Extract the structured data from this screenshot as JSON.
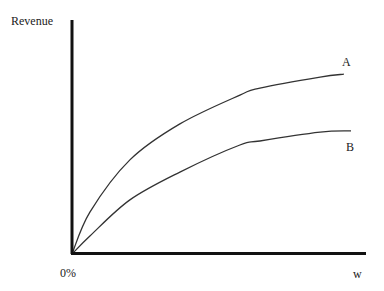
{
  "chart_data": {
    "type": "line",
    "title": "",
    "xlabel": "w",
    "ylabel": "Revenue",
    "x_tick_labels": {
      "origin": "0%",
      "end": "w"
    },
    "xlim": [
      0,
      100
    ],
    "ylim": [
      0,
      100
    ],
    "grid": false,
    "legend": "inline labels at line ends",
    "series": [
      {
        "name": "A",
        "x": [
          0,
          6.1,
          19.7,
          36.7,
          57.1,
          63.9,
          84.4,
          92.5
        ],
        "y": [
          0,
          17.9,
          40.2,
          55.6,
          67.9,
          70.9,
          75.6,
          76.9
        ]
      },
      {
        "name": "B",
        "x": [
          0,
          6.1,
          19.7,
          36.7,
          57.1,
          63.9,
          84.4,
          94.9
        ],
        "y": [
          0,
          7.7,
          23.1,
          35.0,
          46.6,
          48.3,
          52.1,
          52.6
        ]
      }
    ],
    "annotations": [
      "A",
      "B"
    ]
  },
  "labels": {
    "y_axis": "Revenue",
    "x_origin": "0%",
    "x_end": "w",
    "curve_a": "A",
    "curve_b": "B"
  },
  "colors": {
    "axis": "#111111",
    "curve": "#333333",
    "background": "#ffffff"
  }
}
